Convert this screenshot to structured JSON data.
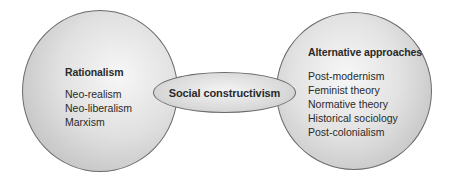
{
  "diagram": {
    "left": {
      "title": "Rationalism",
      "items": [
        "Neo-realism",
        "Neo-liberalism",
        "Marxism"
      ]
    },
    "center": {
      "title": "Social constructivism"
    },
    "right": {
      "title": "Alternative approaches",
      "items": [
        "Post-modernism",
        "Feminist theory",
        "Normative theory",
        "Historical sociology",
        "Post-colonialism"
      ]
    },
    "colors": {
      "outline": "#6b6b6b",
      "fill_light": "#f7f7f7",
      "fill_dark": "#b3b3b3",
      "text": "#2a2a2a"
    }
  }
}
